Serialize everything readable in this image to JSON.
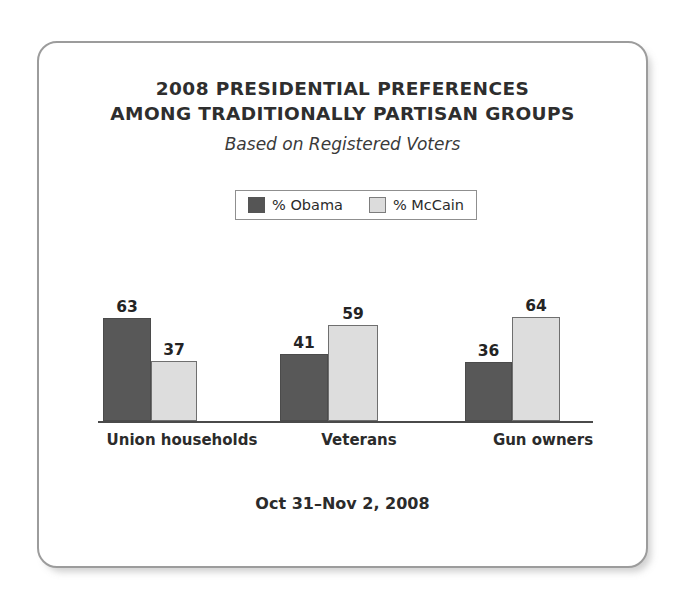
{
  "chart_data": {
    "type": "bar",
    "title": "2008 PRESIDENTIAL PREFERENCES AMONG TRADITIONALLY PARTISAN GROUPS",
    "title_lines": [
      "2008 PRESIDENTIAL PREFERENCES",
      "AMONG TRADITIONALLY PARTISAN GROUPS"
    ],
    "subtitle": "Based on Registered Voters",
    "footer": "Oct 31–Nov 2, 2008",
    "categories": [
      "Union households",
      "Veterans",
      "Gun owners"
    ],
    "series": [
      {
        "name": "% Obama",
        "color": "#585858",
        "values": [
          63,
          41,
          36
        ]
      },
      {
        "name": "% McCain",
        "color": "#dddddd",
        "values": [
          37,
          59,
          64
        ]
      }
    ],
    "xlabel": "",
    "ylabel": "",
    "ylim": [
      0,
      100
    ],
    "grid": false,
    "axis_visible": "baseline-only",
    "legend_position": "top-center",
    "data_labels": true
  },
  "legend": {
    "entries": [
      {
        "label": "% Obama",
        "swatch": "obama-swatch"
      },
      {
        "label": "% McCain",
        "swatch": "mccain-swatch"
      }
    ]
  },
  "groups": [
    {
      "category": "Union households",
      "bars": [
        {
          "series": "% Obama",
          "value": "63"
        },
        {
          "series": "% McCain",
          "value": "37"
        }
      ]
    },
    {
      "category": "Veterans",
      "bars": [
        {
          "series": "% Obama",
          "value": "41"
        },
        {
          "series": "% McCain",
          "value": "59"
        }
      ]
    },
    {
      "category": "Gun owners",
      "bars": [
        {
          "series": "% Obama",
          "value": "36"
        },
        {
          "series": "% McCain",
          "value": "64"
        }
      ]
    }
  ]
}
